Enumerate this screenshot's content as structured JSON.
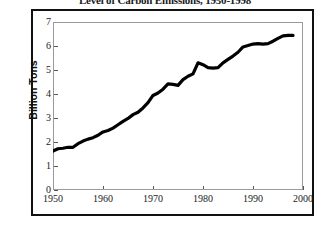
{
  "chart_data": {
    "type": "line",
    "title": "Level of Carbon Emissions, 1950-1998",
    "xlabel": "",
    "ylabel": "Billion Tons",
    "xlim": [
      1950,
      2000
    ],
    "ylim": [
      0,
      7
    ],
    "grid": false,
    "legend": false,
    "xticks": [
      "1950",
      "1960",
      "1970",
      "1980",
      "1990",
      "2000"
    ],
    "yticks": [
      "0",
      "1",
      "2",
      "3",
      "4",
      "5",
      "6",
      "7"
    ],
    "series": [
      {
        "name": "Carbon Emissions",
        "color": "#000000",
        "x": [
          1950,
          1951,
          1952,
          1953,
          1954,
          1955,
          1956,
          1957,
          1958,
          1959,
          1960,
          1961,
          1962,
          1963,
          1964,
          1965,
          1966,
          1967,
          1968,
          1969,
          1970,
          1971,
          1972,
          1973,
          1974,
          1975,
          1976,
          1977,
          1978,
          1979,
          1980,
          1981,
          1982,
          1983,
          1984,
          1985,
          1986,
          1987,
          1988,
          1989,
          1990,
          1991,
          1992,
          1993,
          1994,
          1995,
          1996,
          1997,
          1998
        ],
        "values": [
          1.62,
          1.72,
          1.74,
          1.78,
          1.78,
          1.93,
          2.04,
          2.12,
          2.18,
          2.28,
          2.42,
          2.48,
          2.58,
          2.72,
          2.86,
          2.98,
          3.14,
          3.24,
          3.42,
          3.64,
          3.94,
          4.04,
          4.2,
          4.42,
          4.4,
          4.36,
          4.6,
          4.74,
          4.84,
          5.3,
          5.22,
          5.1,
          5.08,
          5.1,
          5.3,
          5.44,
          5.58,
          5.74,
          5.96,
          6.02,
          6.08,
          6.1,
          6.08,
          6.1,
          6.2,
          6.32,
          6.42,
          6.44,
          6.44
        ]
      }
    ]
  }
}
